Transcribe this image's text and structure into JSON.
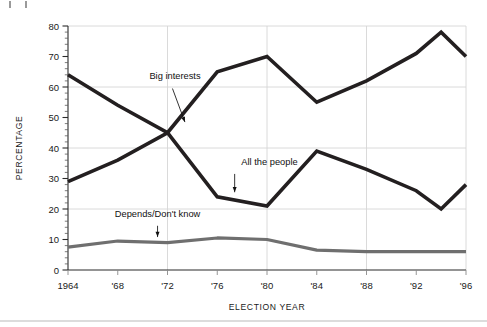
{
  "chart_data": {
    "type": "line",
    "title": "",
    "xlabel": "ELECTION YEAR",
    "ylabel": "PERCENTAGE",
    "xlim": [
      1964,
      1996
    ],
    "ylim": [
      0,
      80
    ],
    "grid": "both",
    "legend": "inline-annotations",
    "x": [
      1964,
      1968,
      1972,
      1976,
      1980,
      1984,
      1988,
      1992,
      1994,
      1996
    ],
    "xtick_labels": [
      "1964",
      "'68",
      "'72",
      "'76",
      "'80",
      "'84",
      "'88",
      "'92",
      "'96"
    ],
    "xtick_values": [
      1964,
      1968,
      1972,
      1976,
      1980,
      1984,
      1988,
      1992,
      1996
    ],
    "ytick_labels": [
      "0",
      "10",
      "20",
      "30",
      "40",
      "50",
      "60",
      "70",
      "80"
    ],
    "ytick_values": [
      0,
      10,
      20,
      30,
      40,
      50,
      60,
      70,
      80
    ],
    "ytick_minor_step": 2,
    "gridline_y_values": [
      20,
      40,
      60,
      80
    ],
    "gridline_x_values": [
      1972,
      1980,
      1988,
      1996
    ],
    "series": [
      {
        "name": "Big interests",
        "color": "#231f20",
        "x": [
          1964,
          1968,
          1972,
          1976,
          1980,
          1984,
          1988,
          1992,
          1994,
          1996
        ],
        "values": [
          29,
          36,
          45,
          65,
          70,
          55,
          62,
          71,
          78,
          70
        ]
      },
      {
        "name": "All the people",
        "color": "#231f20",
        "x": [
          1964,
          1968,
          1972,
          1976,
          1980,
          1984,
          1988,
          1992,
          1994,
          1996
        ],
        "values": [
          64,
          54,
          45,
          24,
          21,
          39,
          33,
          26,
          20,
          28
        ]
      },
      {
        "name": "Depends/Don't know",
        "color": "#6f6f6f",
        "x": [
          1964,
          1968,
          1972,
          1976,
          1980,
          1984,
          1988,
          1992,
          1994,
          1996
        ],
        "values": [
          7.5,
          9.5,
          9,
          10.5,
          10,
          6.5,
          6,
          6,
          6,
          6
        ]
      }
    ],
    "annotations": [
      {
        "label": "Big interests",
        "text_x": 1972.6,
        "text_y": 62.5,
        "anchor": "middle",
        "leader_from_x": 1972.4,
        "leader_from_y": 59.5,
        "leader_to_x": 1973.4,
        "leader_to_y": 48.5
      },
      {
        "label": "All the people",
        "text_x": 1980.2,
        "text_y": 34.5,
        "anchor": "middle",
        "leader_from_x": 1977.4,
        "leader_from_y": 31.5,
        "leader_to_x": 1977.4,
        "leader_to_y": 25.5
      },
      {
        "label": "Depends/Don't know",
        "text_x": 1971.2,
        "text_y": 17.5,
        "anchor": "middle",
        "leader_from_x": 1971.2,
        "leader_from_y": 14.5,
        "leader_to_x": 1971.2,
        "leader_to_y": 10.8
      }
    ]
  }
}
